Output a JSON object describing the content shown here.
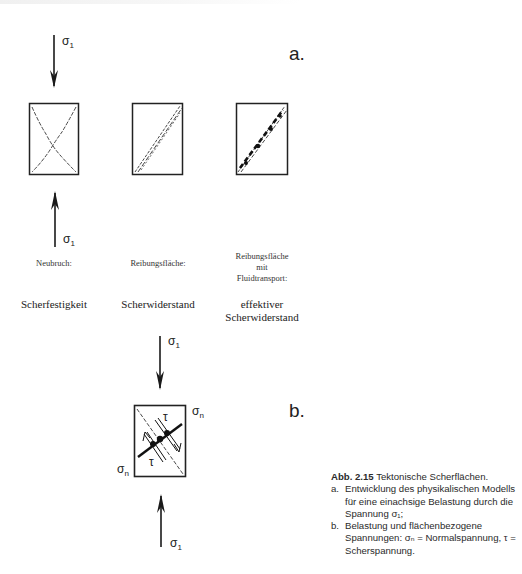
{
  "figure": {
    "panel_a_label": "a.",
    "panel_b_label": "b.",
    "sigma1": "σ",
    "sigma1_sub": "1",
    "sigma_n": "σ",
    "sigma_n_sub": "n",
    "tau": "τ",
    "columns": [
      {
        "title": "Neubruch:",
        "property": "Scherfestigkeit"
      },
      {
        "title": "Reibungsfläche:",
        "property": "Scherwiderstand"
      },
      {
        "title_lines": [
          "Reibungsfläche",
          "mit",
          "Fluidtransport:"
        ],
        "property_lines": [
          "effektiver",
          "Scherwiderstand"
        ]
      }
    ]
  },
  "caption": {
    "number": "Abb. 2.15",
    "title": "Tektonische Scherflächen.",
    "items": [
      {
        "key": "a.",
        "text": "Entwicklung des physikalischen Modells für eine einachsige Belastung durch die Spannung σ₁;"
      },
      {
        "key": "b.",
        "text": "Belastung und flächenbezogene Spannungen: σₙ = Normalspannung, τ = Scherspannung."
      }
    ]
  }
}
